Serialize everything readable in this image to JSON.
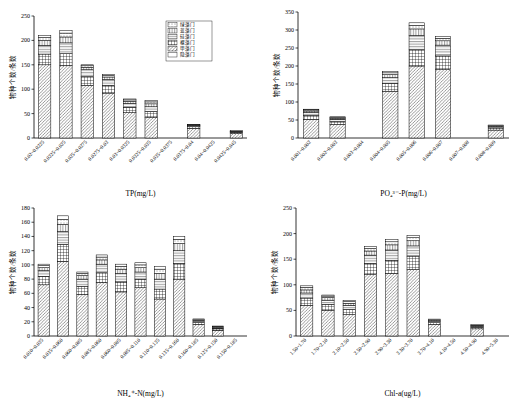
{
  "legend": {
    "items": [
      {
        "label": "绿藻门",
        "pattern": "dots"
      },
      {
        "label": "蓝藻门",
        "pattern": "vhatch"
      },
      {
        "label": "硅藻门",
        "pattern": "hhatch"
      },
      {
        "label": "裸藻门",
        "pattern": "grid"
      },
      {
        "label": "甲藻门",
        "pattern": "dhatch"
      },
      {
        "label": "隐藻门",
        "pattern": "blank"
      }
    ]
  },
  "ylabel_common": "物种个数/条数",
  "chart_data": [
    {
      "type": "bar",
      "id": "tp",
      "title": "",
      "xlabel": "TP(mg/L)",
      "ylabel": "物种个数/条数",
      "ylim": [
        0,
        250
      ],
      "yticks": [
        0,
        50,
        100,
        150,
        200,
        250
      ],
      "grid": false,
      "legend_position": "top-right",
      "categories": [
        "0.02~0.0225",
        "0.0225~0.025",
        "0.025~0.0275",
        "0.0275~0.03",
        "0.03~0.0325",
        "0.0325~0.035",
        "0.035~0.0375",
        "0.0375~0.04",
        "0.04~0.0425",
        "0.0425~0.045"
      ],
      "series": [
        {
          "name": "绿藻门",
          "values": [
            150,
            148,
            108,
            92,
            52,
            42,
            0,
            20,
            0,
            9
          ]
        },
        {
          "name": "蓝藻门",
          "values": [
            22,
            25,
            18,
            16,
            11,
            12,
            0,
            3,
            0,
            2
          ]
        },
        {
          "name": "硅藻门",
          "values": [
            18,
            22,
            14,
            12,
            8,
            10,
            0,
            2,
            0,
            1
          ]
        },
        {
          "name": "裸藻门",
          "values": [
            10,
            12,
            5,
            5,
            4,
            6,
            0,
            1,
            0,
            1
          ]
        },
        {
          "name": "甲藻门",
          "values": [
            6,
            8,
            3,
            3,
            3,
            4,
            0,
            1,
            0,
            1
          ]
        },
        {
          "name": "隐藻门",
          "values": [
            4,
            5,
            2,
            2,
            2,
            3,
            0,
            1,
            0,
            1
          ]
        }
      ],
      "totals": [
        210,
        220,
        150,
        130,
        80,
        77,
        0,
        28,
        0,
        15
      ]
    },
    {
      "type": "bar",
      "id": "po4",
      "title": "",
      "xlabel": "PO₄³⁻-P(mg/L)",
      "ylabel": "物种个数/条数",
      "ylim": [
        0,
        350
      ],
      "yticks": [
        0,
        50,
        100,
        150,
        200,
        250,
        300,
        350
      ],
      "grid": false,
      "legend_position": "none",
      "categories": [
        "0.001~0.002",
        "0.002~0.003",
        "0.003~0.004",
        "0.004~0.005",
        "0.005~0.006",
        "0.006~0.007",
        "0.007~0.008",
        "0.008~0.009"
      ],
      "series": [
        {
          "name": "绿藻门",
          "values": [
            52,
            38,
            0,
            130,
            200,
            190,
            0,
            22,
            12
          ]
        },
        {
          "name": "蓝藻门",
          "values": [
            11,
            8,
            0,
            22,
            45,
            38,
            0,
            6,
            3
          ]
        },
        {
          "name": "硅藻门",
          "values": [
            8,
            6,
            0,
            16,
            40,
            30,
            0,
            4,
            2
          ]
        },
        {
          "name": "裸藻门",
          "values": [
            4,
            3,
            0,
            8,
            18,
            12,
            0,
            2,
            1
          ]
        },
        {
          "name": "甲藻门",
          "values": [
            3,
            2,
            0,
            5,
            10,
            7,
            0,
            1,
            1
          ]
        },
        {
          "name": "隐藻门",
          "values": [
            2,
            2,
            0,
            4,
            7,
            5,
            0,
            1,
            1
          ]
        }
      ],
      "totals": [
        80,
        59,
        0,
        185,
        320,
        282,
        0,
        36,
        20
      ]
    },
    {
      "type": "bar",
      "id": "nh4",
      "title": "",
      "xlabel": "NH₄⁺-N(mg/L)",
      "ylabel": "物种个数/条数",
      "ylim": [
        0,
        180
      ],
      "yticks": [
        0,
        20,
        40,
        60,
        80,
        100,
        120,
        140,
        160,
        180
      ],
      "grid": false,
      "legend_position": "none",
      "categories": [
        "0.010~0.035",
        "0.035~0.060",
        "0.060~0.085",
        "0.085~0.060",
        "0.060~0.085",
        "0.085~0.110",
        "0.110~0.135",
        "0.135~0.160",
        "0.160~0.185",
        "0.125~0.150",
        "0.150~0.185"
      ],
      "series": [
        {
          "name": "绿藻门",
          "values": [
            72,
            105,
            58,
            75,
            62,
            68,
            52,
            80,
            16,
            8
          ]
        },
        {
          "name": "蓝藻门",
          "values": [
            12,
            24,
            12,
            14,
            14,
            12,
            14,
            22,
            3,
            2
          ]
        },
        {
          "name": "硅藻门",
          "values": [
            8,
            18,
            10,
            12,
            12,
            10,
            14,
            18,
            2,
            1
          ]
        },
        {
          "name": "裸藻门",
          "values": [
            4,
            10,
            5,
            6,
            6,
            6,
            8,
            10,
            1,
            1
          ]
        },
        {
          "name": "甲藻门",
          "values": [
            3,
            7,
            3,
            4,
            4,
            4,
            6,
            6,
            1,
            1
          ]
        },
        {
          "name": "隐藻门",
          "values": [
            2,
            5,
            2,
            3,
            3,
            3,
            4,
            4,
            1,
            1
          ]
        }
      ],
      "totals": [
        101,
        169,
        90,
        114,
        101,
        103,
        98,
        140,
        24,
        14
      ]
    },
    {
      "type": "bar",
      "id": "chla",
      "title": "",
      "xlabel": "Chl-a(ug/L)",
      "ylabel": "物种个数/条数",
      "ylim": [
        0,
        250
      ],
      "yticks": [
        0,
        50,
        100,
        150,
        200,
        250
      ],
      "grid": false,
      "legend_position": "none",
      "categories": [
        "1.50~1.70",
        "1.70~2.10",
        "2.10~2.50",
        "2.50~2.90",
        "2.90~3.30",
        "3.30~3.70",
        "3.70~4.10",
        "4.10~4.50",
        "4.50~4.90",
        "4.90~5.30"
      ],
      "series": [
        {
          "name": "绿藻门",
          "values": [
            60,
            50,
            42,
            120,
            122,
            130,
            22,
            0,
            14,
            0
          ]
        },
        {
          "name": "蓝藻门",
          "values": [
            14,
            12,
            10,
            22,
            26,
            26,
            4,
            0,
            3,
            0
          ]
        },
        {
          "name": "硅藻门",
          "values": [
            10,
            8,
            8,
            16,
            20,
            20,
            3,
            0,
            2,
            0
          ]
        },
        {
          "name": "裸藻门",
          "values": [
            6,
            5,
            4,
            8,
            10,
            10,
            2,
            0,
            1,
            0
          ]
        },
        {
          "name": "甲藻门",
          "values": [
            5,
            3,
            3,
            5,
            6,
            6,
            1,
            0,
            1,
            0
          ]
        },
        {
          "name": "隐藻门",
          "values": [
            3,
            2,
            2,
            4,
            4,
            4,
            1,
            0,
            1,
            0
          ]
        }
      ],
      "totals": [
        98,
        80,
        69,
        175,
        188,
        196,
        33,
        0,
        22,
        0
      ]
    }
  ]
}
